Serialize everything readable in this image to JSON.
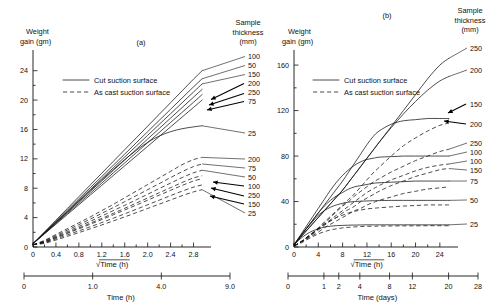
{
  "figure": {
    "panel_a_label": "(a)",
    "panel_b_label": "(b)"
  },
  "legend": {
    "solid_label": "Cut suction surface",
    "dashed_label": "As cast suction surface"
  },
  "panel_a": {
    "y_axis_title_line1": "Weight",
    "y_axis_title_line2": "gain (gm)",
    "y_ticks": [
      "0",
      "4",
      "8",
      "12",
      "16",
      "20",
      "24"
    ],
    "y_values": [
      0,
      4,
      8,
      12,
      16,
      20,
      24
    ],
    "x_axis_title": "√Time (h)",
    "x_ticks": [
      "0",
      "0.4",
      "0.8",
      "1.2",
      "1.6",
      "2.0",
      "2.4",
      "2.8"
    ],
    "x_values": [
      0,
      0.4,
      0.8,
      1.2,
      1.6,
      2.0,
      2.4,
      2.8
    ],
    "x2_axis_title": "Time (h)",
    "x2_ticks": [
      "0",
      "1.0",
      "4.0",
      "9.0"
    ],
    "x2_values": [
      0,
      1.0,
      4.0,
      9.0
    ],
    "series_caption_line1": "Sample",
    "series_caption_line2": "thickness",
    "series_caption_line3": "(mm)",
    "right_labels_solid": [
      "100",
      "50",
      "150",
      "200",
      "250",
      "75"
    ],
    "right_label_solid_low": "25",
    "right_labels_dashed": [
      "200",
      "75",
      "50",
      "100",
      "250",
      "150",
      "25"
    ]
  },
  "panel_b": {
    "y_axis_title_line1": "Weight",
    "y_axis_title_line2": "gain (gm)",
    "y_ticks": [
      "0",
      "40",
      "80",
      "120",
      "160"
    ],
    "y_values": [
      0,
      40,
      80,
      120,
      160
    ],
    "x_axis_title": "√Time (h)",
    "x_ticks": [
      "0",
      "4",
      "8",
      "12",
      "16",
      "20",
      "24"
    ],
    "x_values": [
      0,
      4,
      8,
      12,
      16,
      20,
      24
    ],
    "x2_axis_title": "Time (days)",
    "x2_ticks": [
      "0",
      "1",
      "2",
      "4",
      "8",
      "12",
      "20",
      "28"
    ],
    "x2_values": [
      0,
      1,
      2,
      4,
      8,
      12,
      20,
      28
    ],
    "series_caption_line1": "Sample",
    "series_caption_line2": "thickness",
    "series_caption_line3": "(mm)",
    "right_labels": [
      "250",
      "200",
      "150",
      "200",
      "250",
      "100",
      "100",
      "150",
      "75",
      "50",
      "25"
    ]
  },
  "chart_data": [
    {
      "type": "line",
      "title": "(a) Weight gain vs square-root time (short term)",
      "xlabel": "√Time (h)",
      "ylabel": "Weight gain (gm)",
      "xlim": [
        0,
        3.0
      ],
      "ylim": [
        0,
        26
      ],
      "grid": false,
      "legend_position": "upper-left-inside",
      "x": [
        0,
        0.2,
        0.4,
        0.6,
        0.8,
        1.0,
        1.2,
        1.4,
        1.6,
        1.8,
        2.0,
        2.2,
        2.4,
        2.6,
        2.8,
        2.95
      ],
      "series": [
        {
          "name": "Cut suction surface 100 mm",
          "style": "solid",
          "thickness_mm": 100,
          "values": [
            0.45,
            2.05,
            3.65,
            5.25,
            6.85,
            8.45,
            10.05,
            11.65,
            13.25,
            14.85,
            16.45,
            18.05,
            19.65,
            21.25,
            22.85,
            24.0
          ]
        },
        {
          "name": "Cut suction surface 50 mm",
          "style": "solid",
          "thickness_mm": 50,
          "values": [
            0.45,
            1.98,
            3.5,
            5.03,
            6.55,
            8.08,
            9.6,
            11.13,
            12.65,
            14.18,
            15.7,
            17.23,
            18.75,
            20.28,
            21.8,
            22.9
          ]
        },
        {
          "name": "Cut suction surface 150 mm",
          "style": "solid",
          "thickness_mm": 150,
          "values": [
            0.45,
            1.93,
            3.4,
            4.88,
            6.35,
            7.83,
            9.3,
            10.78,
            12.25,
            13.73,
            15.2,
            16.68,
            18.15,
            19.63,
            21.1,
            22.2
          ]
        },
        {
          "name": "Cut suction surface 200 mm",
          "style": "solid",
          "thickness_mm": 200,
          "values": [
            0.45,
            1.87,
            3.3,
            4.72,
            6.15,
            7.57,
            9.0,
            10.42,
            11.85,
            13.27,
            14.7,
            16.12,
            17.55,
            18.97,
            20.4,
            21.45
          ]
        },
        {
          "name": "Cut suction surface 250 mm",
          "style": "solid",
          "thickness_mm": 250,
          "values": [
            0.45,
            1.83,
            3.2,
            4.58,
            5.95,
            7.33,
            8.7,
            10.08,
            11.45,
            12.83,
            14.2,
            15.58,
            16.95,
            18.33,
            19.7,
            20.75
          ]
        },
        {
          "name": "Cut suction surface 75 mm",
          "style": "solid",
          "thickness_mm": 75,
          "values": [
            0.45,
            1.78,
            3.1,
            4.43,
            5.75,
            7.08,
            8.4,
            9.73,
            11.05,
            12.38,
            13.7,
            15.03,
            16.35,
            17.68,
            19.0,
            20.0
          ]
        },
        {
          "name": "Cut suction surface 25 mm",
          "style": "solid",
          "thickness_mm": 25,
          "values": [
            0.45,
            1.9,
            3.35,
            4.8,
            6.25,
            7.7,
            9.15,
            10.55,
            11.9,
            13.15,
            14.25,
            15.1,
            15.7,
            16.1,
            16.35,
            16.5
          ]
        },
        {
          "name": "As cast suction surface 200 mm",
          "style": "dashed",
          "thickness_mm": 200,
          "values": [
            0.3,
            0.9,
            1.7,
            2.5,
            3.3,
            4.1,
            4.95,
            5.8,
            6.7,
            7.6,
            8.5,
            9.4,
            10.3,
            11.2,
            11.9,
            12.2
          ]
        },
        {
          "name": "As cast suction surface 75 mm",
          "style": "dashed",
          "thickness_mm": 75,
          "values": [
            0.3,
            0.82,
            1.55,
            2.3,
            3.05,
            3.8,
            4.58,
            5.37,
            6.17,
            6.98,
            7.8,
            8.62,
            9.45,
            10.25,
            10.95,
            11.3
          ]
        },
        {
          "name": "As cast suction surface 50 mm",
          "style": "dashed",
          "thickness_mm": 50,
          "values": [
            0.3,
            0.76,
            1.42,
            2.1,
            2.8,
            3.5,
            4.22,
            4.95,
            5.68,
            6.42,
            7.18,
            7.95,
            8.7,
            9.45,
            10.1,
            10.45
          ]
        },
        {
          "name": "As cast suction surface 100 mm",
          "style": "dashed",
          "thickness_mm": 100,
          "values": [
            0.3,
            0.7,
            1.3,
            1.95,
            2.6,
            3.25,
            3.9,
            4.58,
            5.27,
            5.97,
            6.67,
            7.38,
            8.08,
            8.78,
            9.4,
            9.7
          ]
        },
        {
          "name": "As cast suction surface 250 mm",
          "style": "dashed",
          "thickness_mm": 250,
          "values": [
            0.3,
            0.66,
            1.24,
            1.85,
            2.47,
            3.1,
            3.73,
            4.38,
            5.04,
            5.7,
            6.37,
            7.05,
            7.72,
            8.38,
            8.98,
            9.3
          ]
        },
        {
          "name": "As cast suction surface 150 mm",
          "style": "dashed",
          "thickness_mm": 150,
          "values": [
            0.3,
            0.58,
            1.1,
            1.65,
            2.2,
            2.76,
            3.33,
            3.92,
            4.52,
            5.13,
            5.75,
            6.37,
            7.0,
            7.6,
            8.15,
            8.45
          ]
        },
        {
          "name": "As cast suction surface 25 mm",
          "style": "dashed",
          "thickness_mm": 25,
          "values": [
            0.3,
            0.5,
            0.95,
            1.45,
            1.96,
            2.48,
            3.0,
            3.55,
            4.1,
            4.67,
            5.25,
            5.83,
            6.4,
            6.98,
            7.5,
            7.8
          ]
        }
      ]
    },
    {
      "type": "line",
      "title": "(b) Weight gain vs square-root time (long term)",
      "xlabel": "√Time (h)",
      "ylabel": "Weight gain (gm)",
      "xlim": [
        0,
        26
      ],
      "ylim": [
        0,
        168
      ],
      "grid": false,
      "legend_position": "upper-left-inside",
      "x": [
        0,
        1,
        2,
        3,
        4,
        5,
        6,
        7,
        8,
        9,
        10,
        11,
        12,
        13,
        14,
        16,
        18,
        20,
        22,
        24,
        25.5
      ],
      "series": [
        {
          "name": "Cut suction surface 250 mm",
          "style": "solid",
          "thickness_mm": 250,
          "values": [
            2,
            8,
            14,
            20,
            26,
            32,
            38,
            44,
            50,
            57,
            64,
            71,
            78,
            85,
            92,
            106,
            120,
            134,
            148,
            160,
            166
          ]
        },
        {
          "name": "Cut suction surface 200 mm",
          "style": "solid",
          "thickness_mm": 200,
          "values": [
            2,
            8,
            14,
            20,
            26,
            32,
            38,
            44,
            50,
            57,
            64,
            71,
            78,
            85,
            92,
            105,
            117,
            128,
            138,
            146,
            150
          ]
        },
        {
          "name": "Cut suction surface 150 mm",
          "style": "solid",
          "thickness_mm": 150,
          "values": [
            2,
            9,
            16,
            23,
            30,
            37,
            44,
            51,
            58,
            66,
            74,
            82,
            90,
            97,
            102,
            108,
            111,
            112,
            113,
            113,
            113
          ]
        },
        {
          "name": "As cast suction surface 200 mm",
          "style": "dashed",
          "thickness_mm": 200,
          "values": [
            1,
            4,
            8,
            12,
            17,
            22,
            27,
            32,
            37,
            42,
            47,
            53,
            59,
            65,
            70,
            80,
            89,
            96,
            102,
            107,
            109
          ]
        },
        {
          "name": "As cast suction surface 250 mm",
          "style": "dashed",
          "thickness_mm": 250,
          "values": [
            1,
            4,
            8,
            12,
            16,
            21,
            26,
            31,
            36,
            40,
            45,
            49,
            53,
            57,
            60,
            66,
            71,
            76,
            80,
            84,
            86
          ]
        },
        {
          "name": "Cut suction surface 100 mm",
          "style": "solid",
          "thickness_mm": 100,
          "values": [
            2,
            10,
            18,
            26,
            34,
            42,
            50,
            57,
            63,
            68,
            72,
            75,
            77,
            78,
            79,
            79.5,
            80,
            80,
            80,
            80,
            80
          ]
        },
        {
          "name": "As cast suction surface 100 mm",
          "style": "dashed",
          "thickness_mm": 100,
          "values": [
            1,
            4,
            8,
            12,
            16,
            20,
            24,
            28,
            32,
            36,
            40,
            44,
            48,
            51,
            54,
            59,
            63,
            67,
            70,
            72,
            73
          ]
        },
        {
          "name": "As cast suction surface 150 mm",
          "style": "dashed",
          "thickness_mm": 150,
          "values": [
            1,
            4,
            7,
            11,
            15,
            19,
            23,
            26,
            30,
            33,
            36,
            40,
            43,
            46,
            49,
            54,
            58,
            62,
            65,
            68,
            69
          ]
        },
        {
          "name": "Cut suction surface 75 mm",
          "style": "solid",
          "thickness_mm": 75,
          "values": [
            2,
            9,
            16,
            23,
            30,
            36,
            41,
            45,
            48,
            51,
            53,
            54,
            55,
            56,
            56.5,
            57,
            57.5,
            58,
            58,
            58,
            58
          ]
        },
        {
          "name": "As cast suction surface 75 mm",
          "style": "dashed",
          "thickness_mm": 75,
          "values": [
            1,
            4,
            7,
            10,
            13,
            17,
            20,
            23,
            26,
            29,
            32,
            34,
            37,
            39,
            41,
            44,
            47,
            49,
            51,
            52,
            53
          ]
        },
        {
          "name": "Cut suction surface 50 mm",
          "style": "solid",
          "thickness_mm": 50,
          "values": [
            2,
            9,
            16,
            22,
            28,
            32,
            35,
            37,
            38.5,
            39.5,
            40,
            40.3,
            40.5,
            40.7,
            40.8,
            41,
            41,
            41,
            41,
            41,
            41
          ]
        },
        {
          "name": "As cast suction surface 50 mm",
          "style": "dashed",
          "thickness_mm": 50,
          "values": [
            1,
            4,
            8,
            12,
            16,
            20,
            23,
            26,
            28,
            30,
            31.5,
            32.5,
            33.5,
            34,
            34.5,
            35.3,
            36,
            36.5,
            37,
            37,
            37
          ]
        },
        {
          "name": "Cut suction surface 25 mm",
          "style": "solid",
          "thickness_mm": 25,
          "values": [
            2,
            7,
            11,
            14,
            16,
            17.5,
            18.3,
            18.8,
            19,
            19.2,
            19.3,
            19.4,
            19.5,
            19.5,
            19.5,
            19.5,
            19.5,
            19.5,
            19.5,
            19.5,
            19.5
          ]
        },
        {
          "name": "As cast suction surface 25 mm",
          "style": "dashed",
          "thickness_mm": 25,
          "values": [
            1,
            3,
            6,
            9,
            11.5,
            13.5,
            15,
            16,
            16.8,
            17.3,
            17.7,
            18,
            18.2,
            18.3,
            18.4,
            18.5,
            18.6,
            18.6,
            18.7,
            18.7,
            18.7
          ]
        }
      ]
    }
  ]
}
